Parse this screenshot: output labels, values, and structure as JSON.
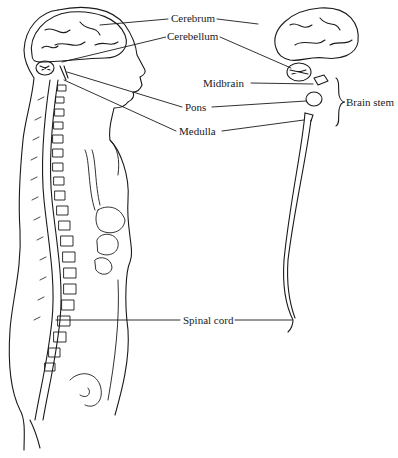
{
  "diagram": {
    "type": "anatomical illustration",
    "labels": {
      "cerebrum": "Cerebrum",
      "cerebellum": "Cerebellum",
      "midbrain": "Midbrain",
      "pons": "Pons",
      "medulla": "Medulla",
      "brain_stem": "Brain stem",
      "spinal_cord": "Spinal cord"
    },
    "groups": [
      {
        "name": "Brain stem",
        "members": [
          "Midbrain",
          "Pons",
          "Medulla"
        ]
      }
    ],
    "colors": {
      "line": "#1a1a1a",
      "background": "#ffffff"
    }
  }
}
